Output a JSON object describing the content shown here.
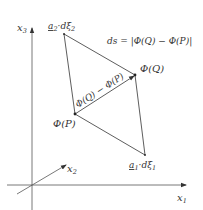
{
  "diagram": {
    "type": "geometric-figure",
    "colors": {
      "stroke": "#333333",
      "axis": "#555555",
      "background": "#ffffff"
    },
    "axes": [
      {
        "id": "x1",
        "label": "x",
        "subscript": "1"
      },
      {
        "id": "x2",
        "label": "x",
        "subscript": "2"
      },
      {
        "id": "x3",
        "label": "x",
        "subscript": "3"
      }
    ],
    "points": {
      "P": {
        "label": "Φ(P)"
      },
      "Q": {
        "label": "Φ(Q)"
      },
      "a1": {
        "label_vec": "a",
        "label_vec_sub": "1",
        "label_rest": "·dξ",
        "label_rest_sub": "1"
      },
      "a2": {
        "label_vec": "a",
        "label_vec_sub": "2",
        "label_rest": "·dξ",
        "label_rest_sub": "2"
      }
    },
    "diagonal_label": "Φ(Q) − Φ(P)",
    "equation": "ds = |Φ(Q) − Φ(P)|"
  }
}
